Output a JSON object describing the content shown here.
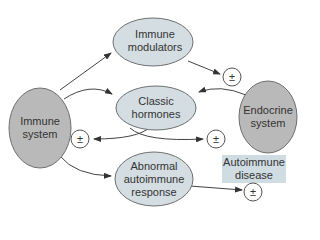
{
  "colors": {
    "system_fill": "#b9b9b9",
    "node_fill": "#d3dde2",
    "box_fill": "#cfdce2",
    "stroke": "#6f6f6f",
    "arrow": "#333333",
    "text": "#333333"
  },
  "nodes": {
    "immune_system": {
      "line1": "Immune",
      "line2": "system"
    },
    "immune_modulators": {
      "line1": "Immune",
      "line2": "modulators"
    },
    "classic_hormones": {
      "line1": "Classic",
      "line2": "hormones"
    },
    "endocrine_system": {
      "line1": "Endocrine",
      "line2": "system"
    },
    "abnormal_response": {
      "line1": "Abnormal",
      "line2": "autoimmune",
      "line3": "response"
    },
    "autoimmune_disease": {
      "line1": "Autoimmune",
      "line2": "disease"
    }
  },
  "modulation_symbol": "±",
  "edges": [
    {
      "from": "Immune system",
      "to": "Immune modulators"
    },
    {
      "from": "Immune modulators",
      "to": "± (Endocrine system)"
    },
    {
      "from": "Immune system",
      "to": "Classic hormones"
    },
    {
      "from": "Endocrine system",
      "to": "Classic hormones"
    },
    {
      "from": "Classic hormones",
      "to": "± (Immune system)"
    },
    {
      "from": "Classic hormones",
      "to": "± (Endocrine system)"
    },
    {
      "from": "Immune system",
      "to": "Abnormal autoimmune response"
    },
    {
      "from": "Abnormal autoimmune response",
      "to": "± (Autoimmune disease)"
    }
  ]
}
